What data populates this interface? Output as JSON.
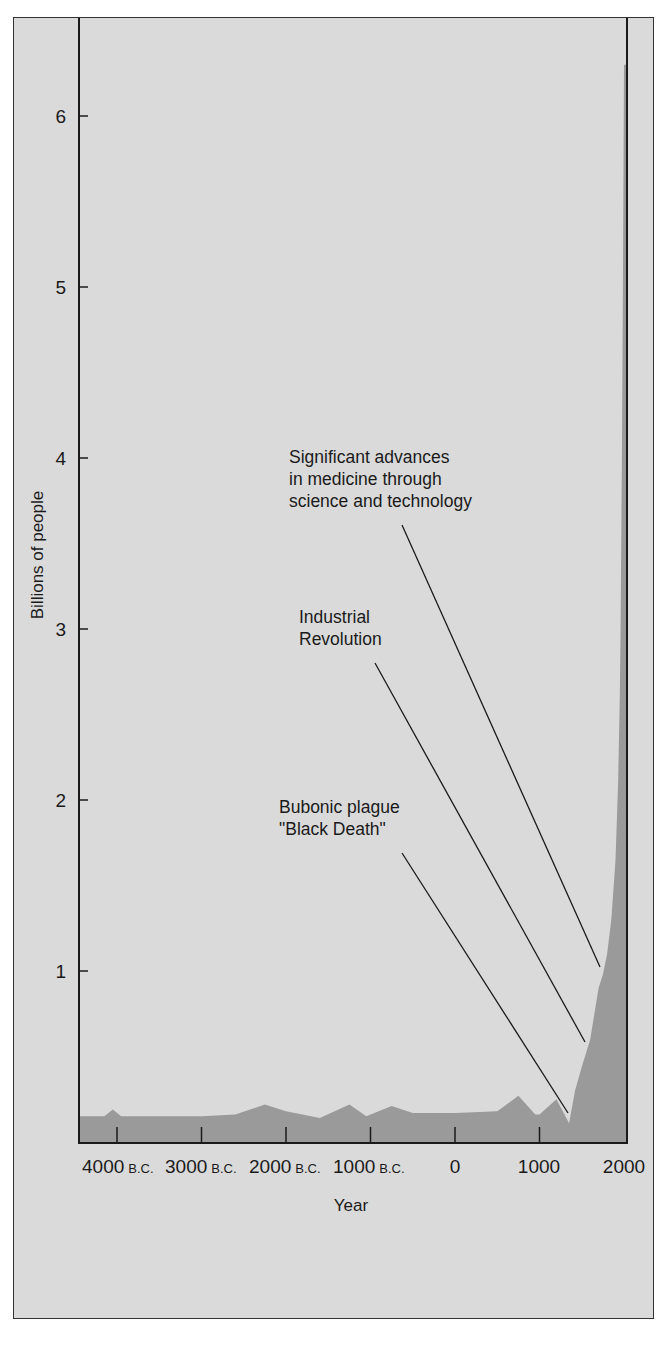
{
  "chart_data": {
    "type": "area",
    "title": "",
    "xlabel": "Year",
    "ylabel": "Billions of people",
    "xlim": [
      -4450,
      2000
    ],
    "ylim": [
      0,
      6.5
    ],
    "grid": false,
    "legend": null,
    "x_ticks": [
      {
        "value": -4000,
        "label": "4000",
        "suffix": "B.C."
      },
      {
        "value": -3000,
        "label": "3000",
        "suffix": "B.C."
      },
      {
        "value": -2000,
        "label": "2000",
        "suffix": "B.C."
      },
      {
        "value": -1000,
        "label": "1000",
        "suffix": "B.C."
      },
      {
        "value": 0,
        "label": "0",
        "suffix": ""
      },
      {
        "value": 1000,
        "label": "1000",
        "suffix": ""
      },
      {
        "value": 2000,
        "label": "2000",
        "suffix": ""
      }
    ],
    "y_ticks": [
      {
        "value": 1,
        "label": "1"
      },
      {
        "value": 2,
        "label": "2"
      },
      {
        "value": 3,
        "label": "3"
      },
      {
        "value": 4,
        "label": "4"
      },
      {
        "value": 5,
        "label": "5"
      },
      {
        "value": 6,
        "label": "6"
      }
    ],
    "series": [
      {
        "name": "World population",
        "points": [
          [
            -4450,
            0.15
          ],
          [
            -4150,
            0.15
          ],
          [
            -4050,
            0.19
          ],
          [
            -3950,
            0.15
          ],
          [
            -3000,
            0.15
          ],
          [
            -2600,
            0.16
          ],
          [
            -2250,
            0.22
          ],
          [
            -2000,
            0.18
          ],
          [
            -1600,
            0.14
          ],
          [
            -1250,
            0.22
          ],
          [
            -1050,
            0.15
          ],
          [
            -750,
            0.21
          ],
          [
            -500,
            0.17
          ],
          [
            0,
            0.17
          ],
          [
            500,
            0.18
          ],
          [
            750,
            0.27
          ],
          [
            950,
            0.16
          ],
          [
            1000,
            0.16
          ],
          [
            1200,
            0.25
          ],
          [
            1350,
            0.11
          ],
          [
            1420,
            0.3
          ],
          [
            1500,
            0.44
          ],
          [
            1600,
            0.6
          ],
          [
            1700,
            0.9
          ],
          [
            1750,
            0.98
          ],
          [
            1800,
            1.1
          ],
          [
            1850,
            1.3
          ],
          [
            1900,
            1.65
          ],
          [
            1930,
            2.1
          ],
          [
            1950,
            2.6
          ],
          [
            1960,
            3.0
          ],
          [
            1975,
            4.0
          ],
          [
            1987,
            5.0
          ],
          [
            1995,
            5.8
          ],
          [
            2000,
            6.3
          ]
        ]
      }
    ],
    "annotations": [
      {
        "id": "plague",
        "lines": [
          "Bubonic plague",
          "\"Black Death\""
        ],
        "points_to_year": 1350,
        "points_to_value": 0.17
      },
      {
        "id": "industrial",
        "lines": [
          "Industrial",
          "Revolution"
        ],
        "points_to_year": 1540,
        "points_to_value": 0.58
      },
      {
        "id": "medicine",
        "lines": [
          "Significant advances",
          "in medicine through",
          "science and technology"
        ],
        "points_to_year": 1720,
        "points_to_value": 1.02
      }
    ],
    "colors": {
      "panel": "#dadada",
      "fill": "#9a9a9a",
      "axis": "#1a1a1a"
    }
  }
}
